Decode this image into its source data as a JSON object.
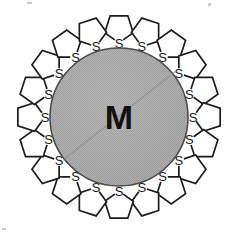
{
  "figure": {
    "kind": "schematic-diagram",
    "core": {
      "label": "M",
      "label_meaning": "metal nanoparticle core",
      "shape": "circle",
      "fill_style": "dithered-halftone-gray",
      "fill_color": "#a8a8a8",
      "outline_color": "#4a4a4a",
      "center_x": 119,
      "center_y": 117,
      "radius": 69,
      "label_font_size": 34
    },
    "ligand": {
      "name": "thiolane-ring",
      "ring_label": "S",
      "ring_vertices": 5,
      "count": 20,
      "label_font_size": 13,
      "outline_color": "#1c1c1c",
      "fill_color": "#ffffff",
      "ring_radius": 15,
      "orbit_radius": 89
    },
    "canvas": {
      "width": 239,
      "height": 236,
      "background": "#ffffff"
    },
    "ligand_angles_deg": [
      -90,
      -72,
      -54,
      -36,
      -18,
      0,
      18,
      36,
      54,
      72,
      90,
      108,
      126,
      144,
      162,
      180,
      198,
      216,
      234,
      252
    ]
  },
  "chart_data": {
    "type": "diagram",
    "title": "",
    "elements": [
      {
        "name": "core",
        "label": "M",
        "count": 1
      },
      {
        "name": "thiolane-ligand",
        "label": "S",
        "count": 20
      }
    ]
  }
}
